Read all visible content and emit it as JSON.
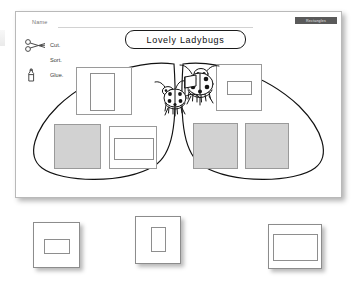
{
  "worksheet": {
    "name_label": "Name",
    "corner_banner": "Rectangles",
    "title": "Lovely Ladybugs",
    "instructions": [
      {
        "label": "Cut.",
        "icon": "scissors-icon"
      },
      {
        "label": "Sort.",
        "icon": "none"
      },
      {
        "label": "Glue.",
        "icon": "glue-bottle-icon"
      }
    ],
    "art": {
      "icon": "ladybugs-illustration",
      "count": 2
    },
    "sort_areas": [
      {
        "side": "left",
        "name": "left-wing",
        "items": [
          {
            "name": "square-portrait-rectangle",
            "fill": "white",
            "inner": "portrait-rectangle"
          },
          {
            "name": "square-solid-gray-a",
            "fill": "gray",
            "inner": "none"
          },
          {
            "name": "square-landscape-rectangle",
            "fill": "white",
            "inner": "landscape-rectangle"
          }
        ]
      },
      {
        "side": "right",
        "name": "right-wing",
        "items": [
          {
            "name": "square-small-landscape-rectangle",
            "fill": "white",
            "inner": "small-landscape-rectangle"
          },
          {
            "name": "square-solid-gray-b",
            "fill": "gray",
            "inner": "none"
          },
          {
            "name": "square-solid-gray-c",
            "fill": "gray",
            "inner": "none"
          }
        ]
      }
    ]
  },
  "cutouts": [
    {
      "name": "cutout-card-small-landscape",
      "shape": "small-landscape-rectangle"
    },
    {
      "name": "cutout-card-portrait",
      "shape": "portrait-rectangle"
    },
    {
      "name": "cutout-card-wide-landscape",
      "shape": "wide-landscape-rectangle"
    }
  ],
  "colors": {
    "paper": "#ffffff",
    "ink": "#1a1a1a",
    "gray_fill": "#d2d2d2",
    "shape_border": "#9a9a9a",
    "banner_bg": "#5a5a5a",
    "muted_text": "#777777"
  }
}
